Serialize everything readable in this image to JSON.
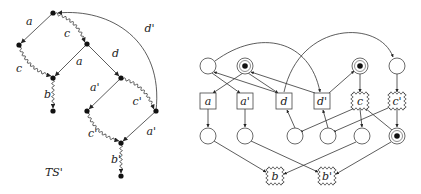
{
  "left_graph": {
    "caption": "TS'",
    "nodes": [
      {
        "id": "n0",
        "x": 53,
        "y": 13
      },
      {
        "id": "n1",
        "x": 19,
        "y": 45
      },
      {
        "id": "n2",
        "x": 87,
        "y": 44
      },
      {
        "id": "n3",
        "x": 53,
        "y": 78
      },
      {
        "id": "n4",
        "x": 53,
        "y": 111
      },
      {
        "id": "n5",
        "x": 121,
        "y": 78
      },
      {
        "id": "n6",
        "x": 87,
        "y": 111
      },
      {
        "id": "n7",
        "x": 156,
        "y": 111
      },
      {
        "id": "n8",
        "x": 121,
        "y": 143
      },
      {
        "id": "n9",
        "x": 121,
        "y": 176
      }
    ],
    "edges": [
      {
        "from": "n0",
        "to": "n1",
        "label": "a",
        "style": "straight"
      },
      {
        "from": "n0",
        "to": "n2",
        "label": "c",
        "style": "wavy"
      },
      {
        "from": "n1",
        "to": "n3",
        "label": "c",
        "style": "wavy"
      },
      {
        "from": "n2",
        "to": "n3",
        "label": "a",
        "style": "straight"
      },
      {
        "from": "n3",
        "to": "n4",
        "label": "b",
        "style": "wavy"
      },
      {
        "from": "n2",
        "to": "n5",
        "label": "d",
        "style": "straight"
      },
      {
        "from": "n5",
        "to": "n6",
        "label": "a'",
        "style": "straight"
      },
      {
        "from": "n5",
        "to": "n7",
        "label": "c'",
        "style": "wavy"
      },
      {
        "from": "n6",
        "to": "n8",
        "label": "c'",
        "style": "wavy"
      },
      {
        "from": "n7",
        "to": "n8",
        "label": "a'",
        "style": "straight"
      },
      {
        "from": "n8",
        "to": "n9",
        "label": "b'",
        "style": "wavy"
      },
      {
        "from": "n7",
        "to": "n0",
        "label": "d'",
        "style": "arc"
      }
    ]
  },
  "petri_net": {
    "places": [
      {
        "id": "p1",
        "x": 208,
        "y": 66,
        "token": false
      },
      {
        "id": "p2",
        "x": 245,
        "y": 66,
        "token": true
      },
      {
        "id": "p3",
        "x": 360,
        "y": 66,
        "token": true
      },
      {
        "id": "p4",
        "x": 397,
        "y": 66,
        "token": false
      },
      {
        "id": "p5",
        "x": 208,
        "y": 136,
        "token": false
      },
      {
        "id": "p6",
        "x": 245,
        "y": 136,
        "token": false
      },
      {
        "id": "p7",
        "x": 295,
        "y": 136,
        "token": false
      },
      {
        "id": "p8",
        "x": 328,
        "y": 136,
        "token": false
      },
      {
        "id": "p9",
        "x": 362,
        "y": 136,
        "token": false
      },
      {
        "id": "p10",
        "x": 397,
        "y": 136,
        "token": true
      }
    ],
    "transitions": [
      {
        "id": "t_a",
        "label": "a",
        "x": 208,
        "y": 101,
        "wavy": false
      },
      {
        "id": "t_a2",
        "label": "a'",
        "x": 245,
        "y": 101,
        "wavy": false
      },
      {
        "id": "t_d",
        "label": "d",
        "x": 284,
        "y": 101,
        "wavy": false
      },
      {
        "id": "t_d2",
        "label": "d'",
        "x": 322,
        "y": 101,
        "wavy": false
      },
      {
        "id": "t_c",
        "label": "c",
        "x": 360,
        "y": 101,
        "wavy": true
      },
      {
        "id": "t_c2",
        "label": "c'",
        "x": 397,
        "y": 101,
        "wavy": true
      },
      {
        "id": "t_b",
        "label": "b",
        "x": 275,
        "y": 176,
        "wavy": true
      },
      {
        "id": "t_b2",
        "label": "b'",
        "x": 327,
        "y": 176,
        "wavy": true
      }
    ]
  }
}
